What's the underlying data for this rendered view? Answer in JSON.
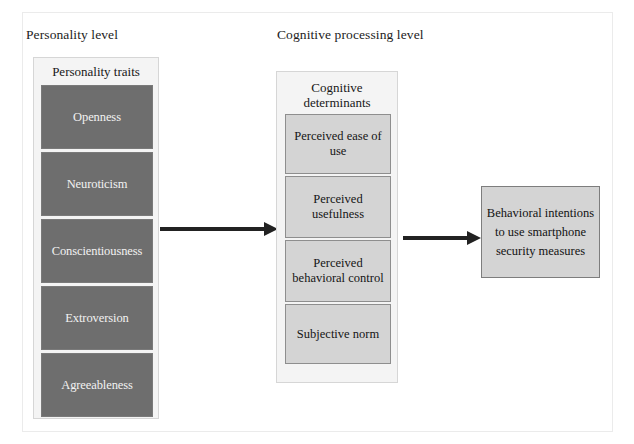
{
  "figure": {
    "levels": [
      {
        "caption": "Personality level"
      },
      {
        "caption": "Cognitive processing level"
      }
    ]
  },
  "personality_panel": {
    "title": "Personality traits",
    "traits": [
      {
        "label": "Openness"
      },
      {
        "label": "Neuroticism"
      },
      {
        "label": "Conscientiousness"
      },
      {
        "label": "Extroversion"
      },
      {
        "label": "Agreeableness"
      }
    ]
  },
  "cognitive_panel": {
    "title": "Cognitive determinants",
    "determinants": [
      {
        "label": "Perceived ease of use"
      },
      {
        "label": "Perceived usefulness"
      },
      {
        "label": "Perceived behavioral control"
      },
      {
        "label": "Subjective norm"
      }
    ]
  },
  "outcome": {
    "label": "Behavioral intentions to use smartphone security measures"
  },
  "arrows": [
    {
      "name": "traits-to-cognition",
      "from": "Personality traits",
      "to": "Cognitive determinants"
    },
    {
      "name": "cognition-to-outcome",
      "from": "Cognitive determinants",
      "to": "Behavioral intentions"
    }
  ],
  "colors": {
    "trait_box_fill": "#6e6e6e",
    "trait_box_text": "#f2f2f2",
    "determinant_box_fill": "#d4d4d4",
    "panel_fill": "#f4f4f4",
    "arrow": "#222222",
    "background": "#ffffff"
  }
}
